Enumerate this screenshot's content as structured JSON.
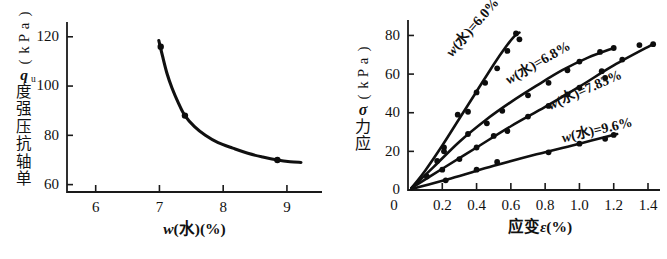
{
  "figure": {
    "background_color": "#ffffff",
    "ink_color": "#101010",
    "panels": [
      "left",
      "right"
    ]
  },
  "chart_data": [
    {
      "id": "left",
      "type": "line",
      "title": "",
      "xlabel": "w(水)(%)",
      "ylabel": "单轴抗压强度 qᵤ (kPa)",
      "ylabel_parts": {
        "prefix": "单轴抗压强度 ",
        "symbol": "q",
        "subscript": "u",
        "suffix": " (kPa)"
      },
      "xlim": [
        5.55,
        9.55
      ],
      "ylim": [
        57.0,
        126.0
      ],
      "xticks": [
        6,
        7,
        8,
        9
      ],
      "xtick_labels": [
        "6",
        "7",
        "8",
        "9"
      ],
      "yticks": [
        60,
        80,
        100,
        120
      ],
      "ytick_labels": [
        "60",
        "80",
        "100",
        "120"
      ],
      "grid": false,
      "legend": false,
      "series": [
        {
          "name": "unconfined compressive strength vs water content",
          "marker": "filled-circle",
          "x": [
            7.02,
            7.4,
            8.85
          ],
          "y": [
            116.0,
            88.0,
            70.0
          ],
          "curve_x": [
            6.99,
            7.05,
            7.12,
            7.2,
            7.3,
            7.4,
            7.55,
            7.72,
            7.92,
            8.15,
            8.4,
            8.62,
            8.85,
            9.05,
            9.22
          ],
          "curve_y": [
            118.5,
            112.0,
            105.0,
            99.0,
            93.0,
            88.0,
            83.5,
            80.0,
            77.0,
            74.8,
            72.6,
            71.2,
            70.0,
            69.3,
            69.0
          ]
        }
      ]
    },
    {
      "id": "right",
      "type": "line",
      "title": "",
      "xlabel": "应变ε(%)",
      "ylabel": "应力σ(kPa)",
      "xlim": [
        0,
        1.47
      ],
      "ylim": [
        0,
        88
      ],
      "xticks": [
        0,
        0.2,
        0.4,
        0.6,
        0.8,
        1.0,
        1.2,
        1.4
      ],
      "xtick_labels": [
        "0",
        "0.2",
        "0.4",
        "0.6",
        "0.8",
        "1.0",
        "1.2",
        "1.4"
      ],
      "yticks": [
        0,
        20,
        40,
        60,
        80
      ],
      "ytick_labels": [
        "0",
        "20",
        "40",
        "60",
        "80"
      ],
      "ytick_labels_shown": [
        "20",
        "40",
        "60",
        "80"
      ],
      "grid": false,
      "legend": false,
      "legend_style": "inline-annotation",
      "series": [
        {
          "name": "w(水)=6.0%",
          "label": "w(水)=6.0%",
          "water_content": 6.0,
          "marker": "filled-circle",
          "x": [
            0.17,
            0.21,
            0.29,
            0.35,
            0.4,
            0.45,
            0.52,
            0.58,
            0.63,
            0.65
          ],
          "y": [
            15.0,
            22.0,
            39.0,
            40.5,
            50.5,
            55.5,
            63.0,
            72.0,
            81.0,
            78.0
          ],
          "curve_x": [
            0.02,
            0.1,
            0.2,
            0.3,
            0.4,
            0.5,
            0.57,
            0.62,
            0.65
          ],
          "curve_y": [
            1.0,
            10.0,
            23.0,
            37.0,
            51.0,
            65.0,
            74.0,
            79.5,
            81.5
          ]
        },
        {
          "name": "w(水)=6.8%",
          "label": "w(水)=6.8%",
          "water_content": 6.8,
          "marker": "filled-circle",
          "x": [
            0.11,
            0.21,
            0.35,
            0.46,
            0.55,
            0.7,
            0.82,
            0.93,
            1.0,
            1.12,
            1.2
          ],
          "y": [
            7.0,
            20.0,
            29.0,
            34.5,
            41.0,
            49.0,
            55.5,
            62.0,
            66.5,
            71.5,
            73.5
          ],
          "curve_x": [
            0.02,
            0.15,
            0.3,
            0.45,
            0.6,
            0.75,
            0.9,
            1.05,
            1.2
          ],
          "curve_y": [
            1.0,
            12.0,
            25.0,
            36.0,
            45.5,
            54.0,
            62.0,
            68.5,
            73.5
          ]
        },
        {
          "name": "w(水)=7.83%",
          "label": "w(水)=7.83%",
          "water_content": 7.83,
          "marker": "filled-circle",
          "x": [
            0.2,
            0.3,
            0.4,
            0.5,
            0.58,
            0.7,
            0.82,
            0.93,
            1.0,
            1.13,
            1.15,
            1.25,
            1.35,
            1.43
          ],
          "y": [
            10.5,
            16.0,
            22.0,
            28.0,
            30.5,
            38.0,
            43.5,
            49.5,
            53.0,
            61.5,
            58.0,
            67.5,
            75.0,
            75.5
          ],
          "curve_x": [
            0.02,
            0.2,
            0.4,
            0.6,
            0.8,
            1.0,
            1.2,
            1.43
          ],
          "curve_y": [
            1.0,
            11.0,
            22.0,
            33.0,
            43.0,
            53.5,
            64.5,
            75.5
          ]
        },
        {
          "name": "w(水)=9.6%",
          "label": "w(水)=9.6%",
          "water_content": 9.6,
          "marker": "filled-circle",
          "x": [
            0.22,
            0.4,
            0.52,
            0.82,
            1.0,
            1.15,
            1.2
          ],
          "y": [
            5.0,
            10.5,
            14.5,
            19.5,
            24.0,
            26.5,
            28.5
          ],
          "curve_x": [
            0.02,
            0.25,
            0.5,
            0.75,
            1.0,
            1.22
          ],
          "curve_y": [
            0.5,
            6.0,
            12.5,
            18.5,
            24.0,
            29.0
          ]
        }
      ],
      "annotations": [
        {
          "text": "w(水)=6.0%",
          "x_pct": 0.175,
          "y_pct": 0.78,
          "rotation": -49
        },
        {
          "text": "w(水)=6.8%",
          "x_pct": 0.4,
          "y_pct": 0.62,
          "rotation": -30
        },
        {
          "text": "w(水)=7.83%",
          "x_pct": 0.565,
          "y_pct": 0.47,
          "rotation": -24
        },
        {
          "text": "w(水)=9.6%",
          "x_pct": 0.615,
          "y_pct": 0.28,
          "rotation": -13
        }
      ]
    }
  ]
}
